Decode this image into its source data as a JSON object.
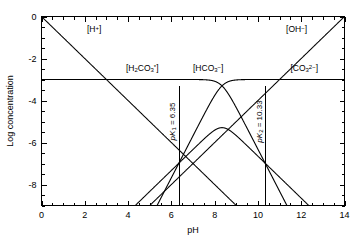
{
  "chart_data": {
    "type": "line",
    "title": "",
    "xlabel": "pH",
    "ylabel": "Log concentration",
    "xlim": [
      0,
      14
    ],
    "ylim": [
      -9,
      0
    ],
    "grid": false,
    "legend_position": "inline-annotations",
    "x_ticks_major": [
      0,
      2,
      4,
      6,
      8,
      10,
      12,
      14
    ],
    "x_tick_labels": [
      "0",
      "2",
      "4",
      "6",
      "8",
      "10",
      "12",
      "14"
    ],
    "x_minor_step": 0.5,
    "y_ticks_major": [
      0,
      -2,
      -4,
      -6,
      -8
    ],
    "y_tick_labels": [
      "0",
      "-2",
      "-4",
      "-6",
      "-8"
    ],
    "y_minor_step": 0.5,
    "constants": {
      "pK1": 6.35,
      "pK2": 10.33,
      "log_CT": -3,
      "pKw": 14
    },
    "series": [
      {
        "name": "[H+]",
        "label_html": "[H<sup>+</sup>]",
        "kind": "proton",
        "description": "log[H+] = -pH, straight line slope -1",
        "slope": -1,
        "intercept": 0,
        "label_x": 2.1,
        "label_y": -0.75
      },
      {
        "name": "[OH-]",
        "label_html": "[OH<sup>-</sup>]",
        "kind": "hydroxide",
        "description": "log[OH-] = pH - 14, straight line slope +1",
        "slope": 1,
        "intercept": -14,
        "label_x": 11.3,
        "label_y": -0.75
      },
      {
        "name": "[H2CO3*]",
        "label_html": "[H<sub>2</sub>CO<sub>3</sub><sup>*</sup>]",
        "kind": "alpha0",
        "description": "log(CT * alpha0), plateau at -3 below pK1, slope -1 then -2",
        "label_x": 3.9,
        "label_y": -2.58
      },
      {
        "name": "[HCO3-]",
        "label_html": "[HCO<sub>3</sub><sup>-</sup>]",
        "kind": "alpha1",
        "description": "log(CT * alpha1), plateau at -3 between pK1 and pK2",
        "label_x": 7.0,
        "label_y": -2.58
      },
      {
        "name": "[CO3 2-]",
        "label_html": "[CO<sub>3</sub><sup>2-</sup>]",
        "kind": "alpha2",
        "description": "log(CT * alpha2), plateau at -3 above pK2",
        "label_x": 11.5,
        "label_y": -2.58
      }
    ],
    "annotations": [
      {
        "id": "pk1",
        "text": "pK1 = 6.35",
        "value": 6.35,
        "rotated": true,
        "line_from_y": -3.3,
        "line_to_y": -9
      },
      {
        "id": "pk2",
        "text": "pK2 = 10.33",
        "value": 10.33,
        "rotated": true,
        "line_from_y": -3.3,
        "line_to_y": -9
      }
    ]
  },
  "labels": {
    "x_axis_title": "pH",
    "y_axis_title": "Log concentration",
    "proton": "[H+]",
    "hydroxide": "[OH-]",
    "carbonic_acid": "[H2CO3*]",
    "bicarbonate": "[HCO3-]",
    "carbonate": "[CO3 2-]",
    "pk1_text": "pK1 = 6.35",
    "pk2_text": "pK2 = 10.33"
  },
  "colors": {
    "background": "#ffffff",
    "ink": "#000000"
  }
}
